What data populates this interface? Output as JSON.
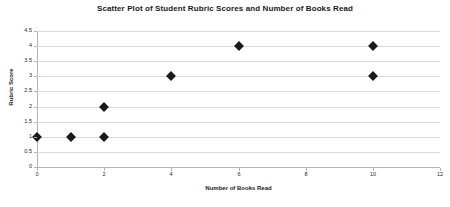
{
  "chart_data": {
    "type": "scatter",
    "title": "Scatter Plot of Student Rubric Scores and Number of Books Read",
    "xlabel": "Number of Books Read",
    "ylabel": "Rubric Score",
    "xlim": [
      0,
      12
    ],
    "ylim": [
      0,
      4.5
    ],
    "xticks": [
      "0",
      "2",
      "4",
      "6",
      "8",
      "10",
      "12"
    ],
    "xtick_values": [
      0,
      2,
      4,
      6,
      8,
      10,
      12
    ],
    "yticks": [
      "0",
      "0.5",
      "1",
      "1.5",
      "2",
      "2.5",
      "3",
      "3.5",
      "4",
      "4.5"
    ],
    "ytick_values": [
      0,
      0.5,
      1,
      1.5,
      2,
      2.5,
      3,
      3.5,
      4,
      4.5
    ],
    "grid": "horizontal",
    "legend": "none",
    "marker": "diamond",
    "marker_color": "#1a1a1a",
    "gridline_color": "#d9d9d9",
    "axis_color": "#b3b3b3",
    "background": "#ffffff",
    "x": [
      0,
      1,
      2,
      2,
      4,
      6,
      10,
      10
    ],
    "y": [
      1,
      1,
      1,
      2,
      3,
      4,
      3,
      4
    ],
    "points": [
      {
        "x": 0,
        "y": 1
      },
      {
        "x": 1,
        "y": 1
      },
      {
        "x": 2,
        "y": 1
      },
      {
        "x": 2,
        "y": 2
      },
      {
        "x": 4,
        "y": 3
      },
      {
        "x": 6,
        "y": 4
      },
      {
        "x": 10,
        "y": 3
      },
      {
        "x": 10,
        "y": 4
      }
    ]
  }
}
